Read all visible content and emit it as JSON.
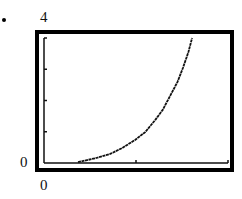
{
  "chart_data": {
    "type": "line",
    "title": "",
    "xlabel": "",
    "ylabel": "",
    "xlim": [
      0,
      2
    ],
    "ylim": [
      0,
      4
    ],
    "x_tick_labels": [
      "0"
    ],
    "y_tick_labels": [
      "0",
      "4"
    ],
    "y_ticks": [
      1,
      2,
      3
    ],
    "x_ticks": [
      1,
      2
    ],
    "grid": false,
    "legend": null,
    "series": [
      {
        "name": "curve",
        "x": [
          0.37,
          0.57,
          0.72,
          0.85,
          0.99,
          1.1,
          1.21,
          1.29,
          1.37,
          1.45,
          1.51,
          1.57,
          1.61
        ],
        "y": [
          0.03,
          0.16,
          0.29,
          0.48,
          0.74,
          0.99,
          1.38,
          1.7,
          2.14,
          2.59,
          3.04,
          3.55,
          4.0
        ]
      }
    ]
  },
  "labels": {
    "y_max": "4",
    "y_min": "0",
    "x_min": "0"
  },
  "colors": {
    "frame": "#000000",
    "curve": "#111111",
    "background": "#ffffff"
  }
}
